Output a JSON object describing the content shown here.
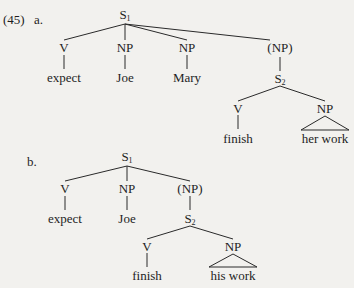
{
  "example": {
    "number": "(45)",
    "a": {
      "label": "a.",
      "root": {
        "cat": "S",
        "sub": "1"
      },
      "nodes": {
        "v": "V",
        "np1": "NP",
        "np2": "NP",
        "np3": "(NP)",
        "expect": "expect",
        "joe": "Joe",
        "mary": "Mary",
        "s2_cat": "S",
        "s2_sub": "2",
        "v2": "V",
        "np4": "NP",
        "finish": "finish",
        "her_work": "her work"
      }
    },
    "b": {
      "label": "b.",
      "root": {
        "cat": "S",
        "sub": "1"
      },
      "nodes": {
        "v": "V",
        "np1": "NP",
        "np2": "(NP)",
        "expect": "expect",
        "joe": "Joe",
        "s2_cat": "S",
        "s2_sub": "2",
        "v2": "V",
        "np3": "NP",
        "finish": "finish",
        "his_work": "his work"
      }
    }
  },
  "colors": {
    "background": "#f2f1ee",
    "ink": "#1e1e1e"
  }
}
